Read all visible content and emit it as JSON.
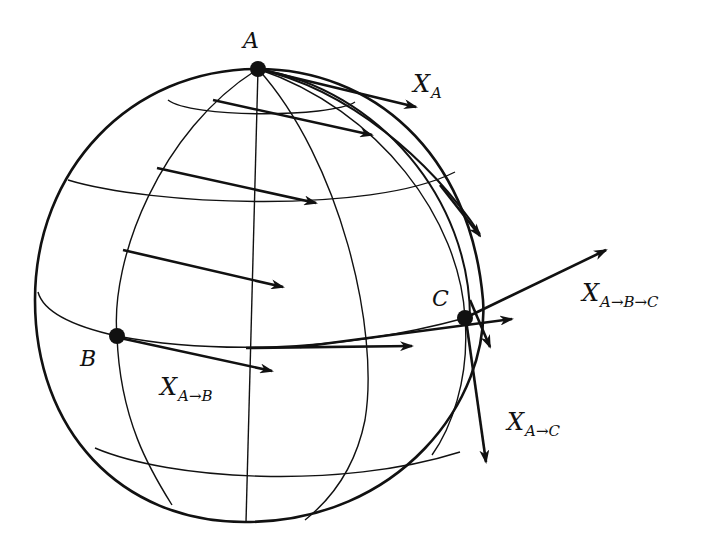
{
  "figure": {
    "colors": {
      "ink": "#111111",
      "background": "#ffffff"
    },
    "points": [
      {
        "id": "A",
        "label": "A",
        "x": 258,
        "y": 69
      },
      {
        "id": "B",
        "label": "B",
        "x": 117,
        "y": 336
      },
      {
        "id": "C",
        "label": "C",
        "x": 465,
        "y": 318
      }
    ],
    "vector_labels": {
      "XA": {
        "main": "X",
        "sub": "A"
      },
      "XAB": {
        "main": "X",
        "sub": "A→B"
      },
      "XAC": {
        "main": "X",
        "sub": "A→C"
      },
      "XABC": {
        "main": "X",
        "sub": "A→B→C"
      }
    },
    "sphere": {
      "cx": 258,
      "cy": 296,
      "rx": 226,
      "ry": 226
    }
  }
}
